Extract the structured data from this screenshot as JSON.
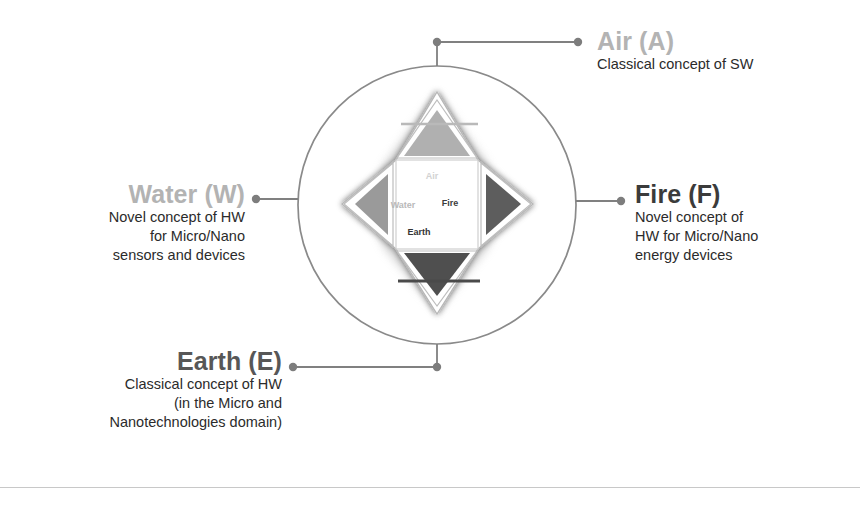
{
  "figure": {
    "title_implicit": "Four-element (Air, Fire, Water, Earth) concept diagram",
    "circle": {
      "cx": 437,
      "cy": 205,
      "r": 139,
      "stroke": "#8a8a8a"
    },
    "connector_color": "#808080",
    "quadrants": [
      {
        "key": "air",
        "heading": "Air (A)",
        "heading_color": "#b3b3b3",
        "body_lines": [
          "Classical concept of SW"
        ],
        "inner_label": "Air",
        "inner_label_color": "#d2d2d2",
        "triangle_fill": "#b0b0b0",
        "symbol": "triangle-up-with-bar",
        "align": "left"
      },
      {
        "key": "fire",
        "heading": "Fire (F)",
        "heading_color": "#3b3b3b",
        "body_lines": [
          "Novel concept of",
          "HW for Micro/Nano",
          "energy devices"
        ],
        "inner_label": "Fire",
        "inner_label_color": "#3c3c3c",
        "triangle_fill": "#5d5d5d",
        "symbol": "triangle-right",
        "align": "left"
      },
      {
        "key": "water",
        "heading": "Water (W)",
        "heading_color": "#b3b3b3",
        "body_lines": [
          "Novel concept of HW",
          "for Micro/Nano",
          "sensors and devices"
        ],
        "inner_label": "Water",
        "inner_label_color": "#b9b9b9",
        "triangle_fill": "#9a9a9a",
        "symbol": "triangle-left",
        "align": "right"
      },
      {
        "key": "earth",
        "heading": "Earth (E)",
        "heading_color": "#575757",
        "body_lines": [
          "Classical concept of HW",
          "(in the Micro and",
          "Nanotechnologies domain)"
        ],
        "inner_label": "Earth",
        "inner_label_color": "#343434",
        "triangle_fill": "#4f4f4f",
        "symbol": "triangle-down-with-bar",
        "align": "right"
      }
    ],
    "rule_color": "#c8c8c8"
  },
  "air": {
    "heading": "Air (A)",
    "line1": "Classical concept of SW"
  },
  "fire": {
    "heading": "Fire (F)",
    "line1": "Novel concept of",
    "line2": "HW for Micro/Nano",
    "line3": "energy devices"
  },
  "water": {
    "heading": "Water (W)",
    "line1": "Novel concept of HW",
    "line2": "for Micro/Nano",
    "line3": "sensors and devices"
  },
  "earth": {
    "heading": "Earth (E)",
    "line1": "Classical concept of HW",
    "line2": "(in the Micro and",
    "line3": "Nanotechnologies domain)"
  },
  "inner": {
    "air": "Air",
    "water": "Water",
    "fire": "Fire",
    "earth": "Earth"
  }
}
